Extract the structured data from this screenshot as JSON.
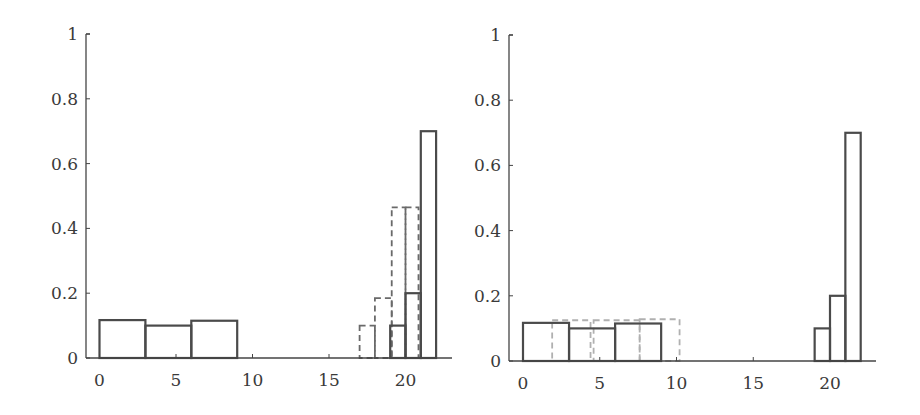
{
  "chart_data": [
    {
      "type": "bar",
      "panel": "left",
      "title": "",
      "xlabel": "",
      "ylabel": "",
      "xlim": [
        -1,
        23
      ],
      "ylim": [
        0,
        1
      ],
      "xticks": [
        "0",
        "5",
        "10",
        "15",
        "20"
      ],
      "yticks": [
        "0",
        "0.2",
        "0.4",
        "0.6",
        "0.8",
        "1"
      ],
      "grid": false,
      "legend": null,
      "series": [
        {
          "name": "solid histogram",
          "style": "solid",
          "color": "#4a4a4a",
          "bins": [
            {
              "x0": 0,
              "x1": 3,
              "value": 0.117
            },
            {
              "x0": 3,
              "x1": 6,
              "value": 0.1
            },
            {
              "x0": 6,
              "x1": 9,
              "value": 0.115
            },
            {
              "x0": 19,
              "x1": 20,
              "value": 0.1
            },
            {
              "x0": 20,
              "x1": 21,
              "value": 0.2
            },
            {
              "x0": 21,
              "x1": 22,
              "value": 0.7
            }
          ]
        },
        {
          "name": "dashed histogram",
          "style": "dashed",
          "color": "#6a6a6a",
          "bins": [
            {
              "x0": 17,
              "x1": 18,
              "value": 0.1
            },
            {
              "x0": 18,
              "x1": 19.1,
              "value": 0.185
            },
            {
              "x0": 19.1,
              "x1": 20,
              "value": 0.465
            },
            {
              "x0": 20,
              "x1": 20.85,
              "value": 0.465
            }
          ]
        }
      ]
    },
    {
      "type": "bar",
      "panel": "right",
      "title": "",
      "xlabel": "",
      "ylabel": "",
      "xlim": [
        -1,
        23
      ],
      "ylim": [
        0,
        1
      ],
      "xticks": [
        "0",
        "5",
        "10",
        "15",
        "20"
      ],
      "yticks": [
        "0",
        "0.2",
        "0.4",
        "0.6",
        "0.8",
        "1"
      ],
      "grid": false,
      "legend": null,
      "series": [
        {
          "name": "solid histogram",
          "style": "solid",
          "color": "#4a4a4a",
          "bins": [
            {
              "x0": 0,
              "x1": 3,
              "value": 0.117
            },
            {
              "x0": 3,
              "x1": 6,
              "value": 0.1
            },
            {
              "x0": 6,
              "x1": 9,
              "value": 0.115
            },
            {
              "x0": 19,
              "x1": 20,
              "value": 0.1
            },
            {
              "x0": 20,
              "x1": 21,
              "value": 0.2
            },
            {
              "x0": 21,
              "x1": 22,
              "value": 0.7
            }
          ]
        },
        {
          "name": "dashed histogram",
          "style": "dashed",
          "color": "#b0b0b0",
          "bins": [
            {
              "x0": 1.9,
              "x1": 4.4,
              "value": 0.125
            },
            {
              "x0": 4.6,
              "x1": 7.6,
              "value": 0.125
            },
            {
              "x0": 7.6,
              "x1": 10.2,
              "value": 0.128
            }
          ]
        }
      ]
    }
  ]
}
